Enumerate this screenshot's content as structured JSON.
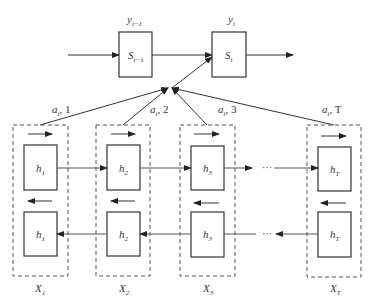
{
  "diagram": {
    "type": "bidirectional-rnn-attention",
    "top": {
      "outputs": [
        {
          "label": "y",
          "sub": "t−1"
        },
        {
          "label": "y",
          "sub": "t"
        }
      ],
      "states": [
        {
          "label": "S",
          "sub": "t−1"
        },
        {
          "label": "S",
          "sub": "t"
        }
      ]
    },
    "attention_labels": [
      {
        "label": "a",
        "sub": "t",
        "suffix": ", 1"
      },
      {
        "label": "a",
        "sub": "t",
        "suffix": ", 2"
      },
      {
        "label": "a",
        "sub": "t",
        "suffix": ", 3"
      },
      {
        "label": "a",
        "sub": "t",
        "suffix": ", T"
      }
    ],
    "columns": [
      {
        "h_label": "h",
        "h_sub": "1",
        "x_label": "X",
        "x_sub": "1"
      },
      {
        "h_label": "h",
        "h_sub": "2",
        "x_label": "X",
        "x_sub": "2"
      },
      {
        "h_label": "h",
        "h_sub": "3",
        "x_label": "X",
        "x_sub": "3"
      },
      {
        "h_label": "h",
        "h_sub": "T",
        "x_label": "X",
        "x_sub": "T"
      }
    ],
    "ellipsis": "···"
  }
}
